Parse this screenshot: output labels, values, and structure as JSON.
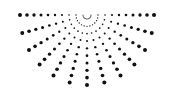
{
  "graphic": {
    "name": "dotted-half-sunburst",
    "color": "#111111",
    "background": "#ffffff",
    "center": {
      "x": 87,
      "y": 15
    },
    "ray_count": 13,
    "angle_start_deg": 180,
    "angle_end_deg": 0,
    "dots_per_ray": 10,
    "inner_radius": 4,
    "outer_radius_x": 67,
    "outer_radius_y": 70,
    "min_dot_radius": 0.5,
    "max_dot_radius": 2.0
  }
}
